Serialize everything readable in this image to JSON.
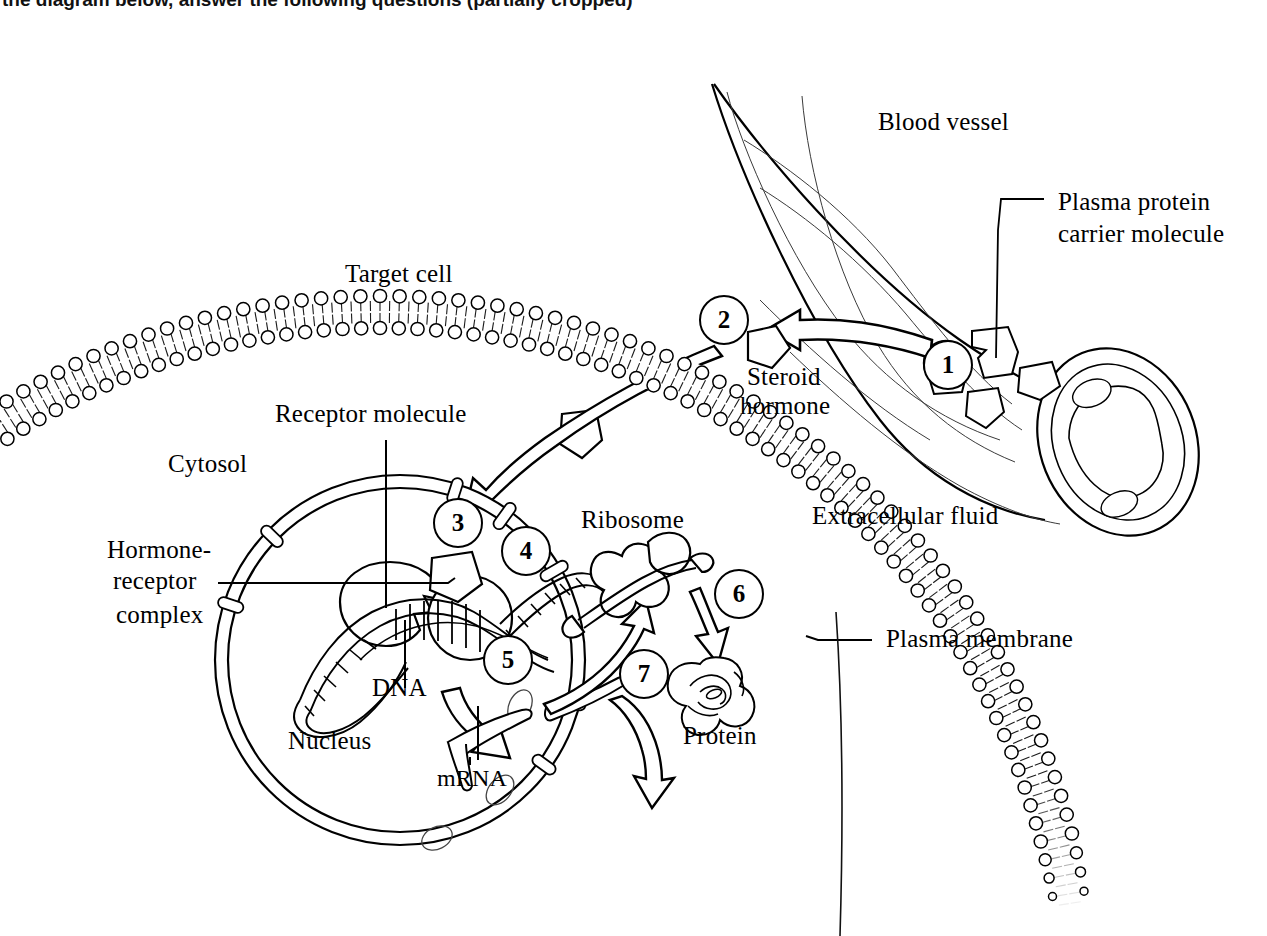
{
  "header": {
    "title": "the diagram below, answer the following questions (partially cropped)"
  },
  "diagram": {
    "labels": {
      "blood_vessel": "Blood vessel",
      "plasma_protein_carrier_line1": "Plasma protein",
      "plasma_protein_carrier_line2": "carrier molecule",
      "steroid_hormone_line1": "Steroid",
      "steroid_hormone_line2": "hormone",
      "target_cell": "Target cell",
      "receptor_molecule": "Receptor molecule",
      "cytosol": "Cytosol",
      "hormone_receptor_line1": "Hormone-",
      "hormone_receptor_line2": "receptor",
      "hormone_receptor_line3": "complex",
      "dna": "DNA",
      "nucleus": "Nucleus",
      "mrna": "mRNA",
      "ribosome": "Ribosome",
      "protein": "Protein",
      "extracellular_fluid": "Extracellular fluid",
      "plasma_membrane": "Plasma membrane"
    },
    "steps": [
      {
        "id": "1",
        "value": "1"
      },
      {
        "id": "2",
        "value": "2"
      },
      {
        "id": "3",
        "value": "3"
      },
      {
        "id": "4",
        "value": "4"
      },
      {
        "id": "5",
        "value": "5"
      },
      {
        "id": "6",
        "value": "6"
      },
      {
        "id": "7",
        "value": "7"
      }
    ],
    "colors": {
      "ink": "#000000",
      "background": "#ffffff",
      "hairline": "#333333"
    }
  }
}
